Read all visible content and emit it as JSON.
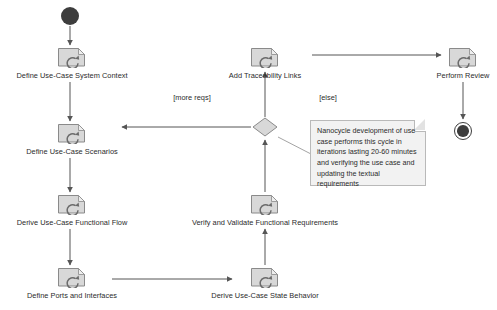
{
  "diagram": {
    "type": "uml-activity-diagram",
    "width": 497,
    "height": 310,
    "background": "#ffffff",
    "line_color": "#555555",
    "text_color": "#2b2b2b",
    "node_fill": "#d8d8d8",
    "note_fill": "#f2f2f2"
  },
  "nodes": {
    "initial": {
      "name": "initial-node",
      "x": 70,
      "y": 16
    },
    "final": {
      "name": "final-node",
      "x": 463,
      "y": 131
    },
    "decision": {
      "name": "decision-node",
      "x": 265,
      "y": 127
    },
    "activities": [
      {
        "id": "define-use-case-system-context",
        "label": "Define Use-Case System Context",
        "x": 72,
        "y": 57
      },
      {
        "id": "define-use-case-scenarios",
        "label": "Define Use-Case Scenarios",
        "x": 72,
        "y": 133
      },
      {
        "id": "derive-use-case-functional-flow",
        "label": "Derive Use-Case Functional Flow",
        "x": 72,
        "y": 204
      },
      {
        "id": "define-ports-and-interfaces",
        "label": "Define Ports and Interfaces",
        "x": 72,
        "y": 277
      },
      {
        "id": "derive-use-case-state-behavior",
        "label": "Derive Use-Case State Behavior",
        "x": 265,
        "y": 277
      },
      {
        "id": "verify-and-validate-functional-requirements",
        "label": "Verify and Validate Functional Requirements",
        "x": 265,
        "y": 204
      },
      {
        "id": "add-traceability-links",
        "label": "Add Traceability Links",
        "x": 265,
        "y": 57
      },
      {
        "id": "perform-review",
        "label": "Perform Review",
        "x": 463,
        "y": 57
      }
    ]
  },
  "guards": [
    {
      "id": "more-reqs",
      "label": "[more reqs]",
      "x": 192,
      "y": 97
    },
    {
      "id": "else",
      "label": "[else]",
      "x": 328,
      "y": 97
    }
  ],
  "note": {
    "id": "nanocycle-note",
    "text": "Nanocycle development of use case performs this cycle in iterations lasting 20-60 minutes and verifying the use case and updating the textual requirements",
    "x": 310,
    "y": 120,
    "width": 116,
    "height": 66
  }
}
